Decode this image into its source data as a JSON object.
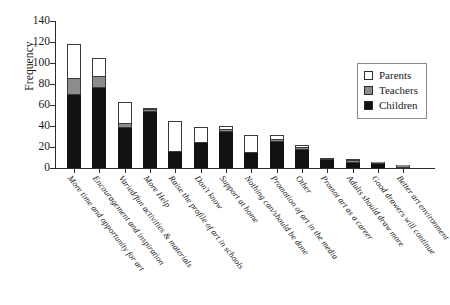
{
  "chart_data": {
    "type": "bar",
    "stacked": true,
    "title": "",
    "xlabel": "",
    "ylabel": "Frequency",
    "ylim": [
      0,
      140
    ],
    "ytick_values": [
      0,
      20,
      40,
      60,
      80,
      100,
      120,
      140
    ],
    "ytick_labels": [
      "0",
      "20",
      "40",
      "60",
      "80",
      "100",
      "120",
      "140"
    ],
    "grid": false,
    "legend_position": "upper-right",
    "categories": [
      "More time and opportunity for art",
      "Encouragement and inspiration",
      "Varied/fun activities & materials",
      "More Help",
      "Raise the profile of art in schools",
      "Don't know",
      "Support at home",
      "Nothing can/should be done",
      "Promotion of art in the media",
      "Other",
      "Promot art as a career",
      "Adults should draw more",
      "Good drawers will continue",
      "Better art environment"
    ],
    "series": [
      {
        "name": "Children",
        "color": "#111111",
        "values": [
          70,
          76,
          38,
          53,
          15,
          24,
          34,
          14,
          25,
          17,
          8,
          5,
          4,
          0
        ]
      },
      {
        "name": "Teachers",
        "color": "#8c8c8c",
        "values": [
          15,
          11,
          4,
          1,
          0,
          0,
          1,
          0,
          1,
          2,
          0,
          1,
          1,
          3
        ]
      },
      {
        "name": "Parents",
        "color": "#ffffff",
        "values": [
          33,
          18,
          21,
          2,
          30,
          15,
          4,
          17,
          5,
          3,
          2,
          1,
          0,
          0
        ]
      }
    ],
    "totals": [
      118,
      105,
      63,
      56,
      45,
      39,
      39,
      31,
      31,
      22,
      10,
      7,
      5,
      3
    ]
  },
  "legend": {
    "items": [
      {
        "label": "Parents",
        "key": "parents"
      },
      {
        "label": "Teachers",
        "key": "teachers"
      },
      {
        "label": "Children",
        "key": "children"
      }
    ]
  },
  "colors": {
    "parents": "#ffffff",
    "teachers": "#8c8c8c",
    "children": "#111111",
    "axis": "#2b2b2b",
    "background": "#ffffff"
  }
}
